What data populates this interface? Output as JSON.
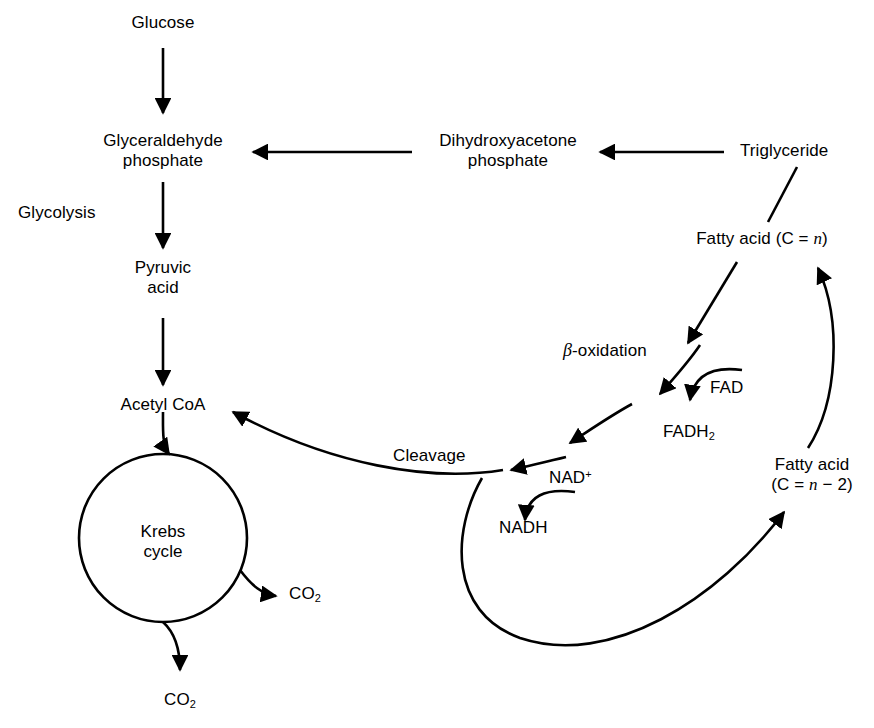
{
  "diagram": {
    "stroke_color": "#000000",
    "background_color": "#ffffff",
    "nodes": {
      "glucose": "Glucose",
      "glyceraldehyde_line1": "Glyceraldehyde",
      "glyceraldehyde_line2": "phosphate",
      "glycolysis": "Glycolysis",
      "pyruvic_line1": "Pyruvic",
      "pyruvic_line2": "acid",
      "acetyl_coa": "Acetyl CoA",
      "krebs_line1": "Krebs",
      "krebs_line2": "cycle",
      "co2_right": "CO",
      "co2_right_sub": "2",
      "co2_bottom": "CO",
      "co2_bottom_sub": "2",
      "dihydroxyacetone_line1": "Dihydroxyacetone",
      "dihydroxyacetone_line2": "phosphate",
      "triglyceride": "Triglyceride",
      "fatty_acid_n_prefix": "Fatty acid (C = ",
      "fatty_acid_n_var": "n",
      "fatty_acid_n_suffix": ")",
      "beta_symbol": "β",
      "beta_oxidation_rest": "-oxidation",
      "fad": "FAD",
      "fadh2": "FADH",
      "fadh2_sub": "2",
      "cleavage": "Cleavage",
      "nad_plus": "NAD",
      "nad_plus_sup": "+",
      "nadh": "NADH",
      "fatty_acid_n2_line1": "Fatty acid",
      "fatty_acid_n2_open": "(C = ",
      "fatty_acid_n2_var": "n",
      "fatty_acid_n2_close": " − 2)"
    }
  }
}
